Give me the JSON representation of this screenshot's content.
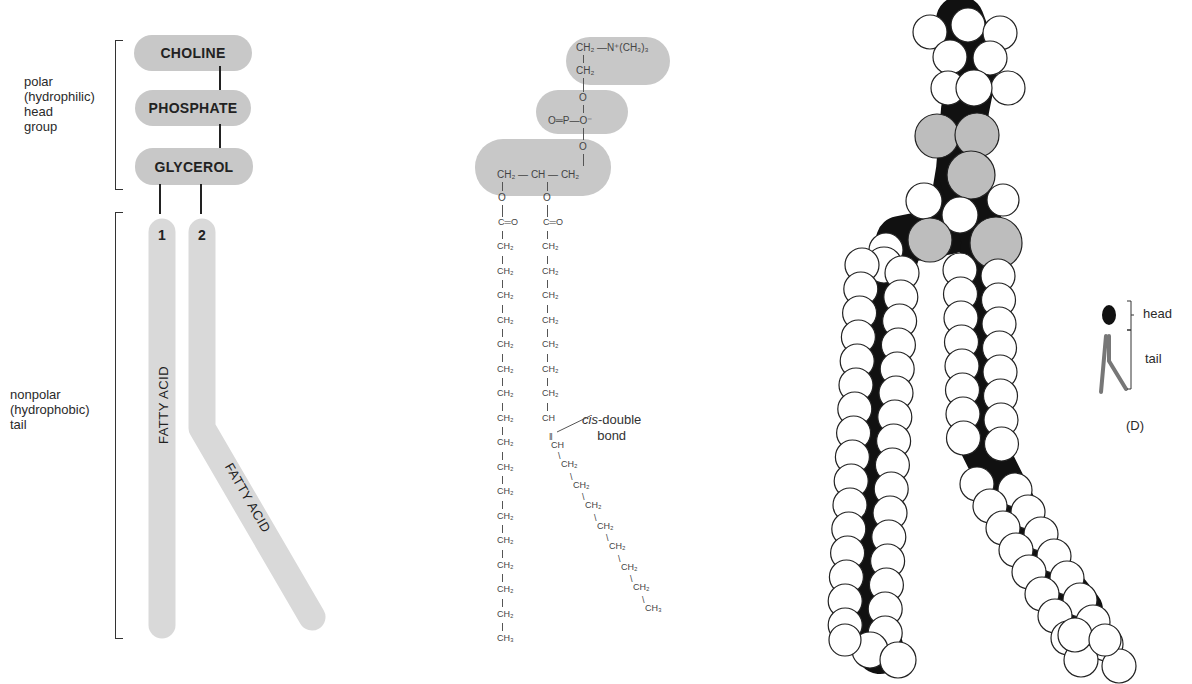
{
  "panel_a": {
    "head_bracket_label": [
      "polar",
      "(hydrophilic)",
      "head",
      "group"
    ],
    "tail_bracket_label": [
      "nonpolar",
      "(hydrophobic)",
      "tail"
    ],
    "head_groups": [
      "CHOLINE",
      "PHOSPHATE",
      "GLYCEROL"
    ],
    "tails": [
      {
        "number": "1",
        "label": "FATTY ACID"
      },
      {
        "number": "2",
        "label": "FATTY ACID"
      }
    ]
  },
  "panel_b": {
    "choline": {
      "line1": "CH₂ —N⁺(CH₃)₃",
      "line2": "CH₂"
    },
    "phosphate": {
      "top_o": "O",
      "center": "O═P—O⁻",
      "bottom_o": "O"
    },
    "glycerol": {
      "row": "CH₂ — CH — CH₂"
    },
    "ester_o": "O",
    "carbonyl": "C═O",
    "chain1": [
      "CH₂",
      "CH₂",
      "CH₂",
      "CH₂",
      "CH₂",
      "CH₂",
      "CH₂",
      "CH₂",
      "CH₂",
      "CH₂",
      "CH₂",
      "CH₂",
      "CH₂",
      "CH₂",
      "CH₂",
      "CH₂",
      "CH₃"
    ],
    "chain2_straight": [
      "CH₂",
      "CH₂",
      "CH₂",
      "CH₂",
      "CH₂",
      "CH₂",
      "CH₂",
      "CH"
    ],
    "chain2_double": "CH",
    "chain2_bent": [
      "CH₂",
      "CH₂",
      "CH₂",
      "CH₂",
      "CH₂",
      "CH₂",
      "CH₂",
      "CH₃"
    ],
    "annotation_italic": "cis",
    "annotation_rest": "-double",
    "annotation_line2": "bond"
  },
  "panel_d": {
    "head_label": "head",
    "tail_label": "tail",
    "caption": "(D)"
  },
  "colors": {
    "pill_gray": "#c8c8c8",
    "tail_gray": "#d9d9d9",
    "atom_white": "#ffffff",
    "atom_gray": "#bdbdbd",
    "bond_black": "#111111"
  }
}
